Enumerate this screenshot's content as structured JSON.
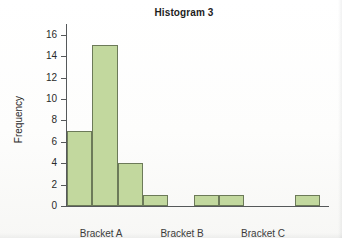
{
  "chart_data": {
    "type": "bar",
    "title": "Histogram 3",
    "xlabel": "",
    "ylabel": "Frequency",
    "ylim": [
      0,
      17
    ],
    "yticks": [
      0,
      2,
      4,
      6,
      8,
      10,
      12,
      14,
      16
    ],
    "ytick_labels": [
      "0",
      "2",
      "4",
      "6",
      "8",
      "10",
      "12",
      "14",
      "16"
    ],
    "grid": false,
    "legend": false,
    "bar_color": "#c2d89e",
    "bar_edge_color": "#6c7a59",
    "axis_color": "#55585a",
    "bin_count": 10,
    "values": [
      7,
      15,
      4,
      1,
      0,
      1,
      1,
      0,
      0,
      1
    ],
    "categories": [
      "1",
      "2",
      "3",
      "4",
      "5",
      "6",
      "7",
      "8",
      "9",
      "10"
    ],
    "xtick_labels": [
      "Bracket A",
      "Bracket B",
      "Bracket C"
    ],
    "xtick_positions": [
      0.135,
      0.455,
      0.775
    ]
  }
}
